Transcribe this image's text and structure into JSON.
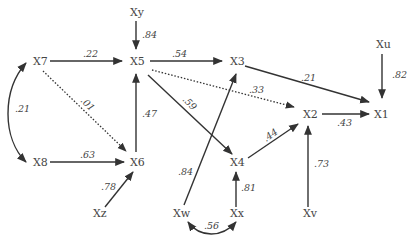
{
  "diagram": {
    "type": "path-diagram",
    "nodes": [
      {
        "id": "X1",
        "label": "X1"
      },
      {
        "id": "X2",
        "label": "X2"
      },
      {
        "id": "X3",
        "label": "X3"
      },
      {
        "id": "X4",
        "label": "X4"
      },
      {
        "id": "X5",
        "label": "X5"
      },
      {
        "id": "X6",
        "label": "X6"
      },
      {
        "id": "X7",
        "label": "X7"
      },
      {
        "id": "X8",
        "label": "X8"
      },
      {
        "id": "Xu",
        "label": "Xu"
      },
      {
        "id": "Xv",
        "label": "Xv"
      },
      {
        "id": "Xw",
        "label": "Xw"
      },
      {
        "id": "Xx",
        "label": "Xx"
      },
      {
        "id": "Xy",
        "label": "Xy"
      },
      {
        "id": "Xz",
        "label": "Xz"
      }
    ],
    "edges": [
      {
        "from": "Xy",
        "to": "X5",
        "label": ".84",
        "style": "solid"
      },
      {
        "from": "X7",
        "to": "X5",
        "label": ".22",
        "style": "solid"
      },
      {
        "from": "X5",
        "to": "X3",
        "label": ".54",
        "style": "solid"
      },
      {
        "from": "X3",
        "to": "X1",
        "label": ".21",
        "style": "solid"
      },
      {
        "from": "Xu",
        "to": "X1",
        "label": ".82",
        "style": "solid"
      },
      {
        "from": "X5",
        "to": "X2",
        "label": ".33",
        "style": "dotted"
      },
      {
        "from": "X7",
        "to": "X6",
        "label": ".01",
        "style": "dotted"
      },
      {
        "from": "X5",
        "to": "X4",
        "label": ".59",
        "style": "solid"
      },
      {
        "from": "X6",
        "to": "X5",
        "label": ".47",
        "style": "solid"
      },
      {
        "from": "X2",
        "to": "X1",
        "label": ".43",
        "style": "solid"
      },
      {
        "from": "X4",
        "to": "X2",
        "label": ".44",
        "style": "solid"
      },
      {
        "from": "X8",
        "to": "X6",
        "label": ".63",
        "style": "solid"
      },
      {
        "from": "Xz",
        "to": "X6",
        "label": ".78",
        "style": "solid"
      },
      {
        "from": "Xw",
        "to": "X3",
        "label": ".84",
        "style": "solid"
      },
      {
        "from": "Xx",
        "to": "X4",
        "label": ".81",
        "style": "solid"
      },
      {
        "from": "Xv",
        "to": "X2",
        "label": ".73",
        "style": "solid"
      },
      {
        "from": "X7",
        "to": "X8",
        "label": ".21",
        "style": "curved-bidirectional"
      },
      {
        "from": "Xw",
        "to": "Xx",
        "label": ".56",
        "style": "curved-bidirectional"
      }
    ]
  }
}
